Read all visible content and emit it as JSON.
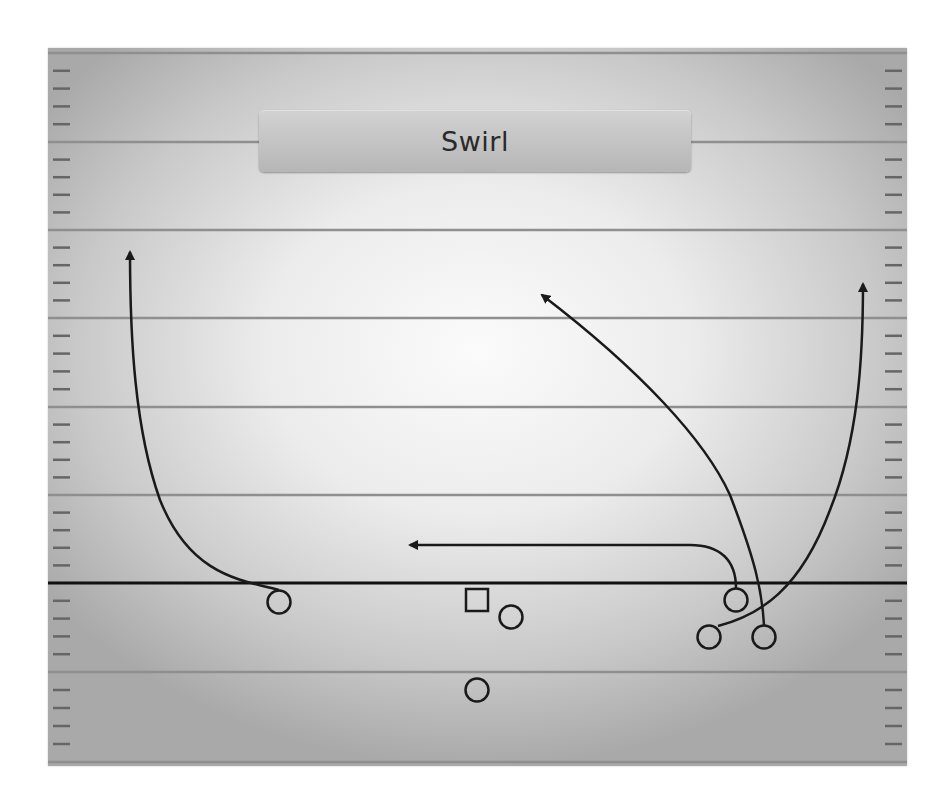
{
  "play": {
    "title": "Swirl",
    "colors": {
      "route": "#1a1a1a",
      "yard_line": "#8a8a8a",
      "line_of_scrimmage": "#111111",
      "hash_mark": "#6a6a6a",
      "title_box": "#c4c4c4"
    }
  },
  "field": {
    "yard_lines_y": [
      53,
      142,
      230,
      318,
      407,
      495,
      672,
      762
    ],
    "line_of_scrimmage_y": 583
  },
  "players": [
    {
      "id": "left-receiver",
      "shape": "circle",
      "x": 279,
      "y": 602
    },
    {
      "id": "center",
      "shape": "square",
      "x": 477,
      "y": 600
    },
    {
      "id": "guard",
      "shape": "circle",
      "x": 511,
      "y": 617
    },
    {
      "id": "running-back",
      "shape": "circle",
      "x": 477,
      "y": 690
    },
    {
      "id": "slot-receiver",
      "shape": "circle",
      "x": 736,
      "y": 600
    },
    {
      "id": "inside-wing",
      "shape": "circle",
      "x": 709,
      "y": 637
    },
    {
      "id": "outside-wing",
      "shape": "circle",
      "x": 764,
      "y": 637
    }
  ],
  "routes": [
    {
      "id": "left-fade-route",
      "from": "left-receiver",
      "arrow_tip": [
        130,
        244
      ]
    },
    {
      "id": "flat-route",
      "from": "slot-receiver",
      "arrow_tip": [
        402,
        545
      ]
    },
    {
      "id": "post-route",
      "from": "outside-wing",
      "arrow_tip": [
        535,
        290
      ]
    },
    {
      "id": "swirl-route",
      "from": "inside-wing",
      "arrow_tip": [
        863,
        276
      ]
    }
  ]
}
